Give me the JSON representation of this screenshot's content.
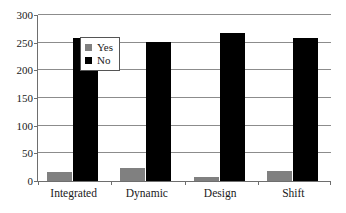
{
  "chart_data": {
    "type": "bar",
    "title": "",
    "xlabel": "",
    "ylabel": "",
    "categories": [
      "Integrated",
      "Dynamic",
      "Design",
      "Shift"
    ],
    "series": [
      {
        "name": "Yes",
        "color": "#808080",
        "values": [
          17,
          23,
          7,
          18
        ]
      },
      {
        "name": "No",
        "color": "#000000",
        "values": [
          258,
          252,
          268,
          258
        ]
      }
    ],
    "ylim": [
      0,
      300
    ],
    "yticks": [
      0,
      50,
      100,
      150,
      200,
      250,
      300
    ],
    "ytick_labels": [
      "0",
      "50",
      "100",
      "150",
      "200",
      "250",
      "300"
    ],
    "grid": true,
    "grid_axis": "y",
    "legend": {
      "position": "top-left",
      "entries": [
        {
          "label": "Yes",
          "color": "#808080"
        },
        {
          "label": "No",
          "color": "#000000"
        }
      ]
    },
    "axis_color": "#6e6e6e",
    "background": "#ffffff"
  }
}
